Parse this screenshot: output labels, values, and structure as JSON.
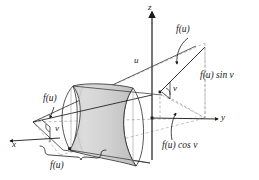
{
  "figure": {
    "background_color": "#ffffff",
    "line_color": "#1a1a1a",
    "dashed_color": "#8c8c8c",
    "surface_fill_light": "#e2e2e2",
    "surface_fill_dark": "#c6c6c6",
    "surface_edge_color": "#2b2b2b"
  },
  "axes": [
    {
      "name": "x-axis",
      "label": "x",
      "direction": "down-left"
    },
    {
      "name": "y-axis",
      "label": "y",
      "direction": "right"
    },
    {
      "name": "z-axis",
      "label": "z",
      "direction": "up"
    }
  ],
  "labels": {
    "z_axis": "z",
    "y_axis": "y",
    "x_axis": "x",
    "u_parameter": "u",
    "f_of_u_top": "f(u)",
    "f_of_u_left": "f(u)",
    "f_of_u_brace": "f(u)",
    "angle_v_right": "v",
    "angle_v_left": "v",
    "f_sin_v": "f(u) sin v",
    "f_cos_v": "f(u) cos v"
  },
  "annotations": [
    {
      "name": "leader-to-generating-line-top",
      "target": "f(u)",
      "style": "curved-arrow"
    },
    {
      "name": "leader-to-radius-left",
      "target": "f(u)",
      "style": "straight-arrow"
    },
    {
      "name": "leader-to-cos-component",
      "target": "f(u) cos v",
      "style": "curved-arrow"
    },
    {
      "name": "brace-under-radius",
      "target": "f(u)",
      "style": "curly-brace"
    }
  ]
}
